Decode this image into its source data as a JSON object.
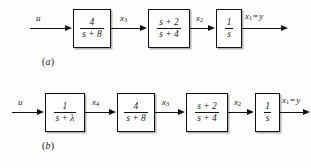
{
  "figure": {
    "background_color": "#fdfdfc",
    "line_color": "#111111"
  },
  "diagrams": [
    {
      "id": "a",
      "caption": "(a)",
      "caption_open": "(",
      "caption_letter": "a",
      "caption_close": ")",
      "input_label": "u",
      "blocks": [
        {
          "name": "gain-block-4-over-s-plus-8",
          "numerator": "4",
          "denominator": "s + 8"
        },
        {
          "name": "lead-block-s-plus-2-over-s-plus-4",
          "numerator": "s + 2",
          "denominator": "s + 4"
        },
        {
          "name": "integrator-block-1-over-s",
          "numerator": "1",
          "denominator": "s"
        }
      ],
      "signals": [
        {
          "name": "signal-x3",
          "base": "x",
          "sub": "3",
          "equals": "",
          "out": ""
        },
        {
          "name": "signal-x2",
          "base": "x",
          "sub": "2",
          "equals": "",
          "out": ""
        },
        {
          "name": "signal-x1-equals-y",
          "base": "x",
          "sub": "1",
          "equals": "=",
          "out": "y"
        }
      ]
    },
    {
      "id": "b",
      "caption": "(b)",
      "caption_open": "(",
      "caption_letter": "b",
      "caption_close": ")",
      "input_label": "u",
      "blocks": [
        {
          "name": "lag-block-1-over-s-plus-lambda",
          "numerator": "1",
          "denominator": "s + λ"
        },
        {
          "name": "gain-block-4-over-s-plus-8",
          "numerator": "4",
          "denominator": "s + 8"
        },
        {
          "name": "lead-block-s-plus-2-over-s-plus-4",
          "numerator": "s + 2",
          "denominator": "s + 4"
        },
        {
          "name": "integrator-block-1-over-s",
          "numerator": "1",
          "denominator": "s"
        }
      ],
      "signals": [
        {
          "name": "signal-x4",
          "base": "x",
          "sub": "4",
          "equals": "",
          "out": ""
        },
        {
          "name": "signal-x3",
          "base": "x",
          "sub": "3",
          "equals": "",
          "out": ""
        },
        {
          "name": "signal-x2",
          "base": "x",
          "sub": "2",
          "equals": "",
          "out": ""
        },
        {
          "name": "signal-x1-equals-y",
          "base": "x",
          "sub": "1",
          "equals": "=",
          "out": "y"
        }
      ]
    }
  ]
}
